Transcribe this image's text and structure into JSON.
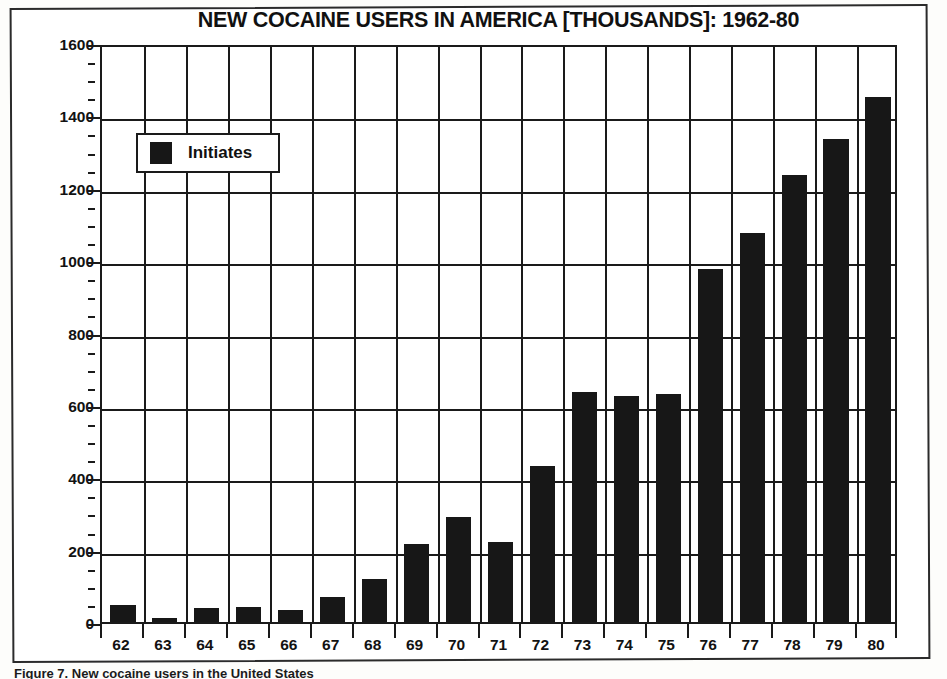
{
  "figure": {
    "title": "NEW COCAINE USERS IN AMERICA [THOUSANDS]: 1962-80",
    "caption": "Figure 7. New cocaine users in the United States"
  },
  "legend": {
    "label": "Initiates",
    "swatch_color": "#171717",
    "position": "inside-top-left"
  },
  "axes": {
    "y_ticks": [
      "0",
      "200",
      "400",
      "600",
      "800",
      "1000",
      "1200",
      "1400",
      "1600"
    ],
    "x_ticks": [
      "62",
      "63",
      "64",
      "65",
      "66",
      "67",
      "68",
      "69",
      "70",
      "71",
      "72",
      "73",
      "74",
      "75",
      "76",
      "77",
      "78",
      "79",
      "80"
    ]
  },
  "chart_data": {
    "type": "bar",
    "title": "NEW COCAINE USERS IN AMERICA [THOUSANDS]: 1962-80",
    "xlabel": "",
    "ylabel": "",
    "ylim": [
      0,
      1600
    ],
    "ytick_step": 200,
    "yminor_step": 50,
    "grid": true,
    "legend_position": "inside-top-left",
    "series": [
      {
        "name": "Initiates",
        "color": "#171717",
        "values": [
          47,
          12,
          38,
          42,
          32,
          70,
          120,
          215,
          290,
          220,
          430,
          635,
          625,
          630,
          975,
          1075,
          1235,
          1335,
          1450
        ]
      }
    ],
    "categories": [
      "62",
      "63",
      "64",
      "65",
      "66",
      "67",
      "68",
      "69",
      "70",
      "71",
      "72",
      "73",
      "74",
      "75",
      "76",
      "77",
      "78",
      "79",
      "80"
    ]
  }
}
